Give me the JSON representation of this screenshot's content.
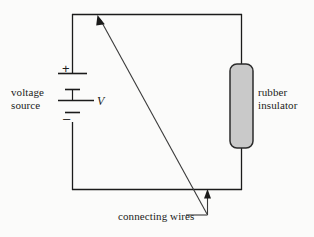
{
  "figure": {
    "type": "circuit-diagram",
    "background_color": "#fbfbfa",
    "line_color": "#1b1b1b",
    "insulator_fill_color": "#c9c9c9",
    "insulator_stroke_color": "#2b2b2b",
    "labels": {
      "voltage_source": "voltage\nsource",
      "rubber_insulator": "rubber\ninsulator",
      "connecting_wires": "connecting wires",
      "voltage_symbol": "V",
      "plus_terminal": "+",
      "minus_terminal": "–"
    },
    "components": {
      "battery": {
        "name": "voltage source battery",
        "plate_count": 4,
        "position": "left-branch"
      },
      "insulator": {
        "name": "rubber insulator",
        "shape": "rounded-rectangle",
        "position": "right-branch"
      },
      "wires": {
        "name": "connecting wires",
        "shape": "rectangle-loop"
      }
    },
    "annotations": [
      {
        "name": "diagonal-leader-arrow",
        "points_to": "top wire",
        "from": [
          208,
          215
        ],
        "to": [
          98,
          16
        ]
      },
      {
        "name": "vertical-leader-arrow",
        "points_to": "bottom wire",
        "from": [
          208,
          215
        ],
        "to": [
          208,
          190
        ]
      },
      {
        "name": "connecting-wires-leader",
        "points_to": "leader junction",
        "from": [
          185,
          215
        ],
        "to": [
          208,
          215
        ]
      }
    ]
  }
}
